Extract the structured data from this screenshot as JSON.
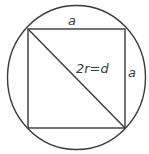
{
  "diagram": {
    "colors": {
      "stroke": "#3a3a3a",
      "text": "#3a3a3a",
      "background": "#ffffff"
    },
    "circle": {
      "cx": 76.5,
      "cy": 77.5,
      "rx": 69,
      "ry": 72
    },
    "square": {
      "x1": 28,
      "y1": 29,
      "x2": 125,
      "y2": 128
    },
    "diagonal": {
      "from": [
        28,
        29
      ],
      "to": [
        125,
        128
      ]
    },
    "labels": {
      "top_side": "a",
      "right_side": "a",
      "diagonal": "2r=d"
    }
  }
}
